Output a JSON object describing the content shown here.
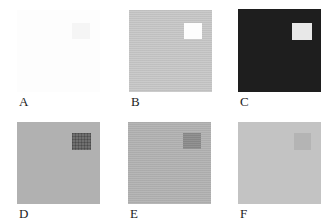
{
  "figure": {
    "background": "#ffffff",
    "rows": 2,
    "cols": 3,
    "label_color": "#1b1b1b",
    "panels": [
      {
        "label": "A",
        "bg": "#fdfdfd",
        "bg_texture": "none",
        "patch": "#f5f5f5",
        "patch_texture": "none",
        "description": "white field with barely visible white patch"
      },
      {
        "label": "B",
        "bg": "#c8c8c8",
        "bg_texture": "hlines",
        "patch": "#fdfdfd",
        "patch_texture": "none",
        "description": "light gray field with white patch"
      },
      {
        "label": "C",
        "bg": "#1e1e1e",
        "bg_texture": "none",
        "patch": "#e8e8e8",
        "patch_texture": "none",
        "description": "near-black field with white patch"
      },
      {
        "label": "D",
        "bg": "#b1b1b1",
        "bg_texture": "none",
        "patch": "#707070",
        "patch_texture": "grid",
        "description": "medium gray field with dark gray patch"
      },
      {
        "label": "E",
        "bg": "#b3b3b3",
        "bg_texture": "hlines",
        "patch": "#8c8c8c",
        "patch_texture": "hlines",
        "description": "medium gray field with mid gray patch"
      },
      {
        "label": "F",
        "bg": "#c3c3c3",
        "bg_texture": "none",
        "patch": "#b4b4b4",
        "patch_texture": "none",
        "description": "light gray field with faint slightly darker patch"
      }
    ]
  }
}
